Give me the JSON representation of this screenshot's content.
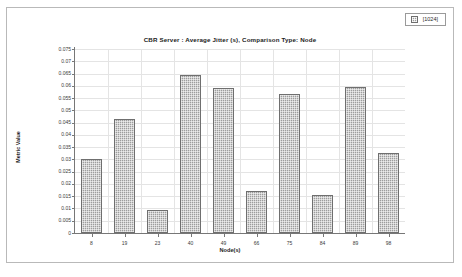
{
  "legend": {
    "entries": [
      {
        "label": "[1024]",
        "swatch_color": "#9c9c9c",
        "icon": "legend-swatch-icon"
      }
    ]
  },
  "chart_data": {
    "type": "bar",
    "title": "CBR Server :  Average Jitter (s), Comparison Type: Node",
    "xlabel": "Node(s)",
    "ylabel": "Metric Value",
    "categories": [
      "8",
      "19",
      "23",
      "40",
      "49",
      "66",
      "75",
      "84",
      "89",
      "98"
    ],
    "values": [
      0.03,
      0.0465,
      0.0095,
      0.0645,
      0.059,
      0.017,
      0.0565,
      0.0155,
      0.0595,
      0.0325
    ],
    "series": [
      {
        "name": "[1024]",
        "values": [
          0.03,
          0.0465,
          0.0095,
          0.0645,
          0.059,
          0.017,
          0.0565,
          0.0155,
          0.0595,
          0.0325
        ]
      }
    ],
    "ylim": [
      0,
      0.075
    ],
    "ytick_step": 0.005,
    "ytick_labels": [
      "0",
      "0.005",
      "0.01",
      "0.015",
      "0.02",
      "0.025",
      "0.03",
      "0.035",
      "0.04",
      "0.045",
      "0.05",
      "0.055",
      "0.06",
      "0.065",
      "0.07",
      "0.075"
    ],
    "ytick_values": [
      0,
      0.005,
      0.01,
      0.015,
      0.02,
      0.025,
      0.03,
      0.035,
      0.04,
      0.045,
      0.05,
      0.055,
      0.06,
      0.065,
      0.07,
      0.075
    ],
    "grid": true,
    "legend_position": "top-right",
    "bar_color": "#9d9d9d",
    "bar_border_color": "#6f6f6f",
    "grid_color": "#e4e4e4",
    "axis_color": "#777777"
  }
}
